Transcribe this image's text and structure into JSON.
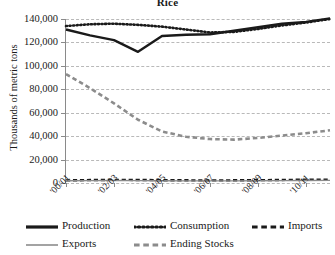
{
  "chart_data": {
    "type": "line",
    "title": "Rice",
    "xlabel": "",
    "ylabel": "Thousands of metric tons",
    "ylim": [
      0,
      140000
    ],
    "ytick_labels": [
      "140,000",
      "120,000",
      "100,000",
      "80,000",
      "60,000",
      "40,000",
      "20,000",
      "0"
    ],
    "ytick_values": [
      140000,
      120000,
      100000,
      80000,
      60000,
      40000,
      20000,
      0
    ],
    "grid": true,
    "legend_position": "bottom",
    "x": [
      "'00/01",
      "'01/02",
      "'02/03",
      "'03/04",
      "'04/05",
      "'05/06",
      "'06/07",
      "'07/08",
      "'08/09",
      "'09/10",
      "'10/11",
      "'11/12"
    ],
    "xtick_labels": [
      "'00/01",
      "'02/03",
      "'04/05",
      "'06/07",
      "'08/09",
      "'10/11"
    ],
    "xtick_indices": [
      0,
      2,
      4,
      6,
      8,
      10
    ],
    "series": [
      {
        "name": "Production",
        "style": "solid",
        "color": "#1a1a1a",
        "width": 2.4,
        "values": [
          131000,
          126000,
          122000,
          112000,
          125500,
          126500,
          127000,
          130000,
          133000,
          136000,
          137500,
          140500
        ]
      },
      {
        "name": "Consumption",
        "style": "dotted",
        "color": "#1a1a1a",
        "width": 2.6,
        "values": [
          134000,
          135500,
          136000,
          135000,
          133500,
          131000,
          128500,
          129000,
          131500,
          134500,
          137000,
          140000
        ]
      },
      {
        "name": "Imports",
        "style": "dashed",
        "color": "#1a1a1a",
        "width": 2.4,
        "values": [
          2200,
          2500,
          2700,
          2600,
          2400,
          2300,
          2200,
          2300,
          2400,
          2600,
          2800,
          2900
        ]
      },
      {
        "name": "Exports",
        "style": "solid",
        "color": "#8c8c8c",
        "width": 1.4,
        "values": [
          1900,
          2000,
          2100,
          2000,
          1900,
          1850,
          1800,
          1850,
          1900,
          2000,
          2100,
          2200
        ]
      },
      {
        "name": "Ending Stocks",
        "style": "dashed",
        "color": "#8c8c8c",
        "width": 2.6,
        "values": [
          93000,
          81000,
          68000,
          54000,
          44000,
          39500,
          37500,
          37000,
          38500,
          40500,
          42500,
          45000
        ]
      }
    ],
    "legend": [
      {
        "name": "Production",
        "style": "solid",
        "color": "#1a1a1a",
        "width": 3.2
      },
      {
        "name": "Consumption",
        "style": "dotted",
        "color": "#1a1a1a",
        "width": 3.2
      },
      {
        "name": "Imports",
        "style": "dashed",
        "color": "#1a1a1a",
        "width": 3.2
      },
      {
        "name": "Exports",
        "style": "solid",
        "color": "#8c8c8c",
        "width": 1.6
      },
      {
        "name": "Ending Stocks",
        "style": "dashed",
        "color": "#8c8c8c",
        "width": 3.2
      }
    ]
  }
}
